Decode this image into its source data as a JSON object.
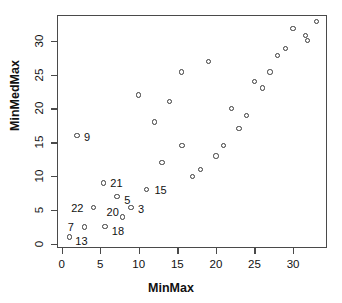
{
  "chart_data": {
    "type": "scatter",
    "title": "",
    "xlabel": "MinMax",
    "ylabel": "MinMedMax",
    "xlim": [
      -0.6,
      34.4
    ],
    "ylim": [
      -0.6,
      33.8
    ],
    "xticks": [
      0,
      5,
      10,
      15,
      20,
      25,
      30
    ],
    "yticks": [
      0,
      5,
      10,
      15,
      20,
      25,
      30
    ],
    "grid": false,
    "legend": null,
    "marker": "open-circle",
    "marker_color": "#3a3a3a",
    "points": [
      {
        "x": 1.0,
        "y": 1.0,
        "label": "13",
        "label_dx": 6,
        "label_dy": 4
      },
      {
        "x": 2.0,
        "y": 16.0,
        "label": "9",
        "label_dx": 7,
        "label_dy": 1
      },
      {
        "x": 3.0,
        "y": 2.5,
        "label": "7",
        "label_dx": -17,
        "label_dy": 0
      },
      {
        "x": 4.1,
        "y": 5.4,
        "label": "22",
        "label_dx": -22,
        "label_dy": 1
      },
      {
        "x": 5.4,
        "y": 9.0,
        "label": "21",
        "label_dx": 7,
        "label_dy": 0
      },
      {
        "x": 5.6,
        "y": 2.6,
        "label": "18",
        "label_dx": 7,
        "label_dy": 5
      },
      {
        "x": 7.2,
        "y": 7.0,
        "label": "5",
        "label_dx": 7,
        "label_dy": 3
      },
      {
        "x": 7.9,
        "y": 4.0,
        "label": "20",
        "label_dx": -16,
        "label_dy": -5
      },
      {
        "x": 9.0,
        "y": 5.4,
        "label": "3",
        "label_dx": 7,
        "label_dy": 2
      },
      {
        "x": 10.0,
        "y": 22.0,
        "label": null
      },
      {
        "x": 11.0,
        "y": 8.0,
        "label": "15",
        "label_dx": 8,
        "label_dy": 0
      },
      {
        "x": 12.0,
        "y": 18.0,
        "label": null
      },
      {
        "x": 13.0,
        "y": 12.0,
        "label": null
      },
      {
        "x": 14.0,
        "y": 21.0,
        "label": null
      },
      {
        "x": 15.5,
        "y": 25.4,
        "label": null
      },
      {
        "x": 15.6,
        "y": 14.5,
        "label": null
      },
      {
        "x": 17.0,
        "y": 10.0,
        "label": null
      },
      {
        "x": 18.0,
        "y": 11.0,
        "label": null
      },
      {
        "x": 19.0,
        "y": 26.9,
        "label": null
      },
      {
        "x": 20.0,
        "y": 13.0,
        "label": null
      },
      {
        "x": 21.0,
        "y": 14.5,
        "label": null
      },
      {
        "x": 22.0,
        "y": 20.0,
        "label": null
      },
      {
        "x": 23.0,
        "y": 17.0,
        "label": null
      },
      {
        "x": 24.0,
        "y": 19.0,
        "label": null
      },
      {
        "x": 25.0,
        "y": 24.0,
        "label": null
      },
      {
        "x": 26.0,
        "y": 23.0,
        "label": null
      },
      {
        "x": 27.0,
        "y": 25.4,
        "label": null
      },
      {
        "x": 28.0,
        "y": 27.8,
        "label": null
      },
      {
        "x": 29.0,
        "y": 28.9,
        "label": null
      },
      {
        "x": 30.0,
        "y": 31.8,
        "label": null
      },
      {
        "x": 31.6,
        "y": 30.8,
        "label": null
      },
      {
        "x": 31.9,
        "y": 30.0,
        "label": null
      },
      {
        "x": 33.0,
        "y": 32.8,
        "label": null
      }
    ]
  }
}
